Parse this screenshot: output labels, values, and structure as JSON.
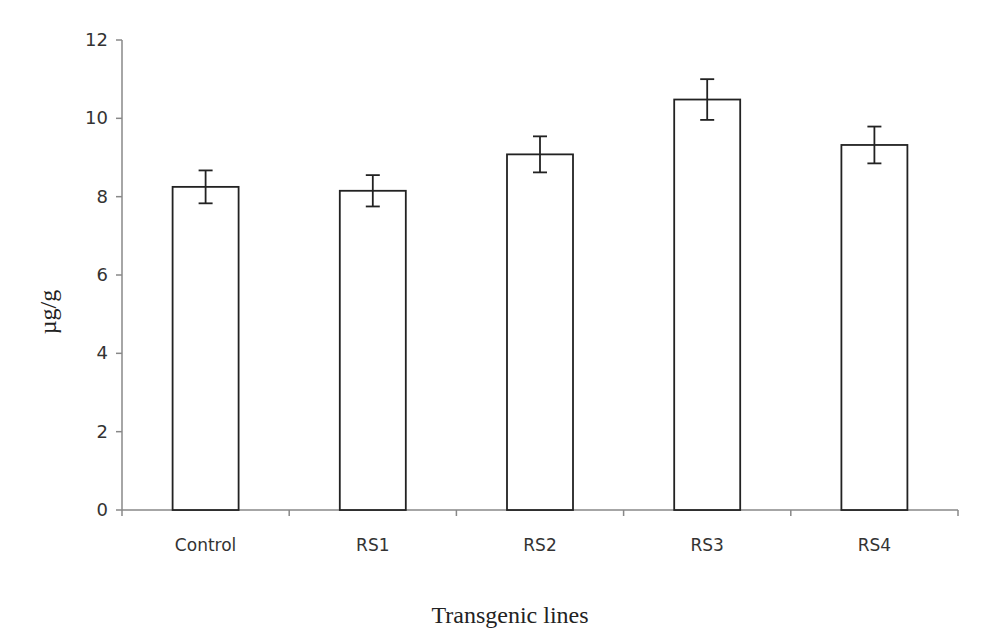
{
  "chart_data": {
    "type": "bar",
    "title": "",
    "xlabel": "Transgenic lines",
    "ylabel": "µg/g",
    "categories": [
      "Control",
      "RS1",
      "RS2",
      "RS3",
      "RS4"
    ],
    "values": [
      8.25,
      8.15,
      9.08,
      10.48,
      9.32
    ],
    "error": [
      0.42,
      0.4,
      0.46,
      0.52,
      0.47
    ],
    "ylim": [
      0,
      12
    ],
    "yticks": [
      0,
      2,
      4,
      6,
      8,
      10,
      12
    ],
    "grid": false,
    "legend": null,
    "bar_fill": "#ffffff",
    "bar_stroke": "#222222"
  }
}
